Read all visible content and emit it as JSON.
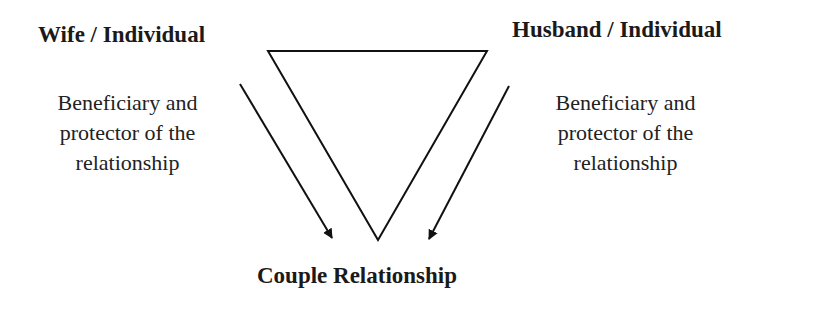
{
  "diagram": {
    "left_node": {
      "title": "Wife / Individual",
      "description_lines": [
        "Beneficiary and",
        "protector of the",
        "relationship"
      ]
    },
    "right_node": {
      "title": "Husband / Individual",
      "description_lines": [
        "Beneficiary and",
        "protector of the",
        "relationship"
      ]
    },
    "bottom_node": {
      "title": "Couple Relationship"
    },
    "shapes": {
      "triangle": "inverted triangle (outline)",
      "arrows": [
        "left arrow pointing down-right to Couple Relationship",
        "right arrow pointing down-left to Couple Relationship"
      ]
    },
    "colors": {
      "stroke": "#111111",
      "text": "#1a1a1a",
      "background": "#ffffff"
    }
  }
}
